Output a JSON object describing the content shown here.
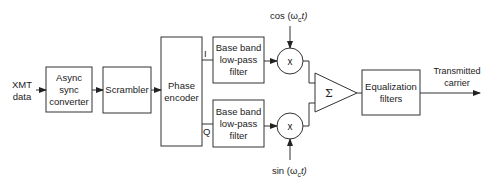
{
  "diagram": {
    "input_label": "XMT\ndata",
    "blocks": [
      {
        "id": "async",
        "label": "Async\nsync\nconverter"
      },
      {
        "id": "scrambler",
        "label": "Scrambler"
      },
      {
        "id": "phase_encoder",
        "label": "Phase\nencoder"
      },
      {
        "id": "lpf_i",
        "label": "Base band\nlow-pass\nfilter"
      },
      {
        "id": "lpf_q",
        "label": "Base band\nlow-pass\nfilter"
      },
      {
        "id": "equalization",
        "label": "Equalization\nfilters"
      }
    ],
    "multipliers": [
      {
        "id": "mult_i",
        "symbol": "x"
      },
      {
        "id": "mult_q",
        "symbol": "x"
      }
    ],
    "summer": {
      "symbol": "Σ"
    },
    "branch_labels": {
      "i": "I",
      "q": "Q"
    },
    "carrier_labels": {
      "cos": "cos (ω",
      "cos_sub": "c",
      "cos_end": "t)",
      "sin": "sin (ω",
      "sin_sub": "c",
      "sin_end": "t)"
    },
    "output_label": "Transmitted\ncarrier"
  }
}
